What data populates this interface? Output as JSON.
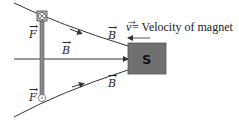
{
  "diagram": {
    "magnet": {
      "pole_label": "S",
      "fill_color": "#707070"
    },
    "velocity_label": {
      "symbol": "v",
      "text": " = Velocity of magnet"
    },
    "field_labels": {
      "top": "B",
      "middle": "B",
      "bottom": "B"
    },
    "force_labels": {
      "top": "F",
      "bottom": "F"
    },
    "force_symbols": {
      "top": "into-page (⊗)",
      "bottom": "out-of-page (⊙)"
    },
    "colors": {
      "line": "#333333",
      "rod": "#8a8a8a",
      "magnet": "#707070"
    }
  }
}
